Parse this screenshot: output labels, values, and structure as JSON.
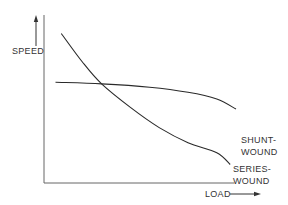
{
  "chart_data": {
    "type": "line",
    "title": "",
    "xlabel": "LOAD",
    "ylabel": "SPEED",
    "xlim": [
      0,
      100
    ],
    "ylim": [
      0,
      100
    ],
    "grid": false,
    "axis_ticks": false,
    "series": [
      {
        "name": "SHUNT-WOUND",
        "label_lines": [
          "SHUNT-",
          "WOUND"
        ],
        "x": [
          6,
          30,
          55,
          75,
          90,
          100
        ],
        "y": [
          60,
          59,
          57,
          54,
          50,
          44
        ]
      },
      {
        "name": "SERIES-WOUND",
        "label_lines": [
          "SERIES-",
          "WOUND"
        ],
        "x": [
          9,
          20,
          30,
          45,
          60,
          75,
          90,
          97
        ],
        "y": [
          89,
          72,
          59,
          45,
          33,
          24,
          18,
          11
        ]
      }
    ],
    "legend": "direct-labels-right",
    "axis_arrows": {
      "y": "up",
      "x": "right"
    }
  }
}
